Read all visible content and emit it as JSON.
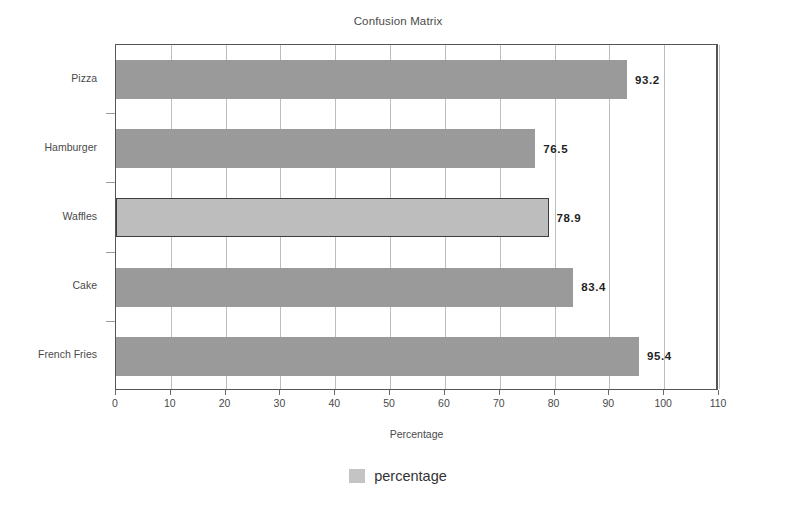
{
  "chart_data": {
    "type": "bar",
    "orientation": "horizontal",
    "title": "Confusion Matrix",
    "xlabel": "Percentage",
    "ylabel": "",
    "categories": [
      "Pizza",
      "Hamburger",
      "Waffles",
      "Cake",
      "French Fries"
    ],
    "values": [
      93.2,
      76.5,
      78.9,
      83.4,
      95.4
    ],
    "value_labels": [
      "93.2",
      "76.5",
      "78.9",
      "83.4",
      "95.4"
    ],
    "series": [
      {
        "name": "percentage",
        "values": [
          93.2,
          76.5,
          78.9,
          83.4,
          95.4
        ]
      }
    ],
    "xlim": [
      0,
      110
    ],
    "xticks": [
      0,
      10,
      20,
      30,
      40,
      50,
      60,
      70,
      80,
      90,
      100,
      110
    ],
    "xtick_labels": [
      "0",
      "10",
      "20",
      "30",
      "40",
      "50",
      "60",
      "70",
      "80",
      "90",
      "100",
      "110"
    ],
    "grid": "vertical",
    "legend": {
      "position": "bottom",
      "entries": [
        {
          "label": "percentage",
          "color": "#c4c4c4"
        }
      ]
    },
    "bar_color": "#9a9a9a",
    "highlight_bar_color": "#bdbdbd",
    "highlight_bar_border": "#3d3d3d",
    "highlighted_category": "Waffles",
    "plot_border_color": "#555555",
    "gridline_color": "#bdbdbd"
  }
}
